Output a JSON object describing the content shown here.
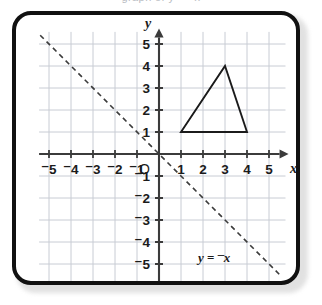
{
  "page": {
    "cutoff_caption": "graph of y = ⁻x"
  },
  "figure": {
    "frame_color": "#111111",
    "background": "#ffffff"
  },
  "chart_data": {
    "type": "line",
    "title": "",
    "subtitle": "",
    "xlabel": "x",
    "ylabel": "y",
    "xlim": [
      -5.4,
      5.7
    ],
    "ylim": [
      -5.9,
      5.6
    ],
    "grid": true,
    "grid_color": "#c8ccd4",
    "axis_color": "#3b3b3b",
    "legend": "none",
    "origin_label": "O",
    "xticks": [
      -5,
      -4,
      -3,
      -2,
      -1,
      1,
      2,
      3,
      4,
      5
    ],
    "yticks": [
      5,
      4,
      3,
      2,
      1,
      -1,
      -2,
      -3,
      -4,
      -5
    ],
    "xticklabels": [
      "⁻5",
      "⁻4",
      "⁻3",
      "⁻2",
      "⁻1",
      "1",
      "2",
      "3",
      "4",
      "5"
    ],
    "yticklabels": [
      "5",
      "4",
      "3",
      "2",
      "1",
      "⁻1",
      "⁻2",
      "⁻3",
      "⁻4",
      "⁻5"
    ],
    "series": [
      {
        "name": "y = ⁻x",
        "type": "line",
        "style": "dashed",
        "color": "#3b3b3b",
        "slope": -1,
        "intercept": 0,
        "x": [
          -5.4,
          5.5
        ],
        "values": [
          5.4,
          -5.5
        ],
        "annotation": {
          "text_parts": [
            "y",
            " = ",
            "⁻",
            "x"
          ],
          "text": "y = ⁻x",
          "x": 2.5,
          "y": -4.6
        }
      },
      {
        "name": "triangle",
        "type": "polygon",
        "color": "#1b1b1b",
        "fill": "none",
        "vertices": [
          [
            1,
            1
          ],
          [
            4,
            1
          ],
          [
            3,
            4
          ]
        ],
        "closed": true
      }
    ]
  }
}
